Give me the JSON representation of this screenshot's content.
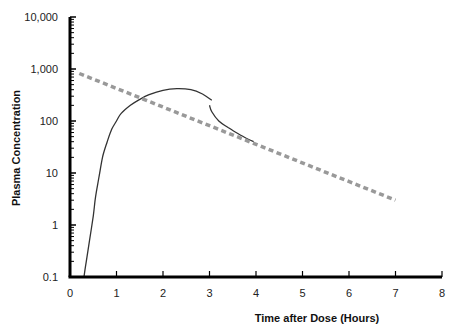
{
  "chart_data": {
    "type": "line",
    "title": "",
    "xlabel": "Time after Dose (Hours)",
    "ylabel": "Plasma Concentration",
    "xlim": [
      0,
      8
    ],
    "ylim": [
      0.1,
      10000
    ],
    "yscale": "log",
    "grid": false,
    "legend": null,
    "x_ticks": [
      "0",
      "1",
      "2",
      "3",
      "4",
      "5",
      "6",
      "7",
      "8"
    ],
    "y_ticks": [
      "0.1",
      "1",
      "10",
      "100",
      "1,000",
      "10,000"
    ],
    "series": [
      {
        "name": "observed-concentration",
        "style": "solid",
        "color": "#333333",
        "segments": [
          {
            "x": [
              0.3,
              0.35,
              0.42,
              0.5,
              0.55,
              0.62,
              0.7,
              0.8,
              0.9,
              1.0,
              1.1,
              1.3,
              1.5,
              1.7,
              2.0,
              2.3,
              2.6,
              2.85,
              3.05
            ],
            "y": [
              0.1,
              0.2,
              0.5,
              1.5,
              3.5,
              8,
              20,
              40,
              70,
              100,
              140,
              200,
              260,
              320,
              390,
              420,
              400,
              330,
              250
            ]
          },
          {
            "x": [
              3.0,
              3.05,
              3.2,
              3.4,
              3.6,
              3.8,
              3.95
            ],
            "y": [
              200,
              150,
              100,
              75,
              58,
              46,
              40
            ]
          }
        ]
      },
      {
        "name": "elimination-extrapolation",
        "style": "dashed",
        "color": "#999999",
        "x": [
          0.2,
          7.0
        ],
        "y": [
          820,
          3
        ]
      }
    ]
  }
}
